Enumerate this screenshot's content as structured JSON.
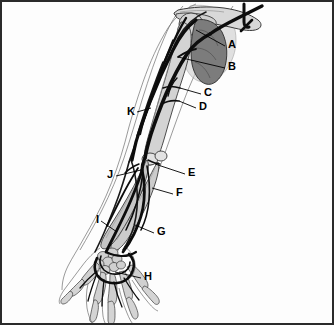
{
  "figure": {
    "background_color": "#fdfdfd",
    "frame_color": "#2b2b2b",
    "vessel_color": "#111111",
    "bone_fill": "#d8d8d8",
    "bone_shade": "#9a9a9a",
    "scapula_fill": "#7c7c7c",
    "outline_color": "#3a3a3a",
    "label_color": "#000000"
  },
  "labels": [
    {
      "id": "A",
      "text": "A",
      "x": 228,
      "y": 44
    },
    {
      "id": "B",
      "text": "B",
      "x": 228,
      "y": 66
    },
    {
      "id": "C",
      "text": "C",
      "x": 204,
      "y": 92
    },
    {
      "id": "D",
      "text": "D",
      "x": 199,
      "y": 106
    },
    {
      "id": "E",
      "text": "E",
      "x": 188,
      "y": 172
    },
    {
      "id": "F",
      "text": "F",
      "x": 176,
      "y": 192
    },
    {
      "id": "G",
      "text": "G",
      "x": 157,
      "y": 231
    },
    {
      "id": "H",
      "text": "H",
      "x": 144,
      "y": 276
    },
    {
      "id": "I",
      "text": "I",
      "x": 98,
      "y": 219
    },
    {
      "id": "J",
      "text": "J",
      "x": 111,
      "y": 174
    },
    {
      "id": "K",
      "text": "K",
      "x": 130,
      "y": 111
    }
  ],
  "leader_lines": [
    {
      "for": "A",
      "from_x": 225,
      "from_y": 46,
      "to_x": 196,
      "to_y": 30
    },
    {
      "for": "B",
      "from_x": 225,
      "from_y": 68,
      "to_x": 178,
      "to_y": 57
    },
    {
      "for": "C",
      "from_x": 201,
      "from_y": 94,
      "to_x": 180,
      "to_y": 88
    },
    {
      "for": "D",
      "from_x": 196,
      "from_y": 108,
      "to_x": 179,
      "to_y": 101
    },
    {
      "for": "E",
      "from_x": 185,
      "from_y": 174,
      "to_x": 155,
      "to_y": 164
    },
    {
      "for": "F",
      "from_x": 173,
      "from_y": 194,
      "to_x": 152,
      "to_y": 188
    },
    {
      "for": "G",
      "from_x": 154,
      "from_y": 233,
      "to_x": 135,
      "to_y": 225
    },
    {
      "for": "H",
      "from_x": 141,
      "from_y": 278,
      "to_x": 115,
      "to_y": 272
    },
    {
      "for": "I",
      "from_x": 101,
      "from_y": 221,
      "to_x": 117,
      "to_y": 232
    },
    {
      "for": "J",
      "from_x": 116,
      "from_y": 176,
      "to_x": 141,
      "to_y": 170
    },
    {
      "for": "K",
      "from_x": 137,
      "from_y": 112,
      "to_x": 151,
      "to_y": 108
    }
  ],
  "parts": {
    "clavicle": "clavicle",
    "scapula": "scapula",
    "humerus": "humerus",
    "radius": "radius",
    "ulna": "ulna",
    "carpals": "carpal-bones",
    "metacarpals": "metacarpal-bones",
    "phalanges": "phalanges",
    "arteries": "arterial-tree",
    "veins": "venous-tree",
    "limb_outline": "limb-skin-outline"
  }
}
